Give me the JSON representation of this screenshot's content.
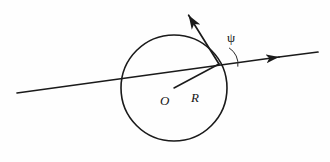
{
  "figure": {
    "background_color": "#fefefe",
    "ink_color": "#1a1a1a",
    "labels": {
      "center": "O",
      "radius": "R",
      "angle": "ψ"
    },
    "geometry": {
      "circle": {
        "center_x": 174,
        "center_y": 88,
        "radius": 53,
        "stroke_width": 1.6
      },
      "intersection_point": {
        "x": 219,
        "y": 64
      },
      "secant_line": {
        "start_x": 17,
        "start_y": 93,
        "end_x": 318,
        "end_y": 52,
        "stroke_width": 1.7,
        "arrowhead_x": 279,
        "arrowhead_y": 57
      },
      "ray_arrow": {
        "start_x": 219,
        "start_y": 64,
        "end_x": 186,
        "end_y": 11,
        "stroke_width": 1.7
      },
      "radius_line": {
        "start_x": 174,
        "start_y": 88,
        "end_x": 219,
        "end_y": 64,
        "stroke_width": 1.5
      },
      "angle_arc": {
        "center_x": 219,
        "center_y": 64,
        "arc_radius": 19,
        "start_angle_deg": 58,
        "end_angle_deg": 352
      },
      "label_positions": {
        "O": {
          "x": 160,
          "y": 105
        },
        "R": {
          "x": 191,
          "y": 102
        },
        "psi": {
          "x": 227,
          "y": 42
        }
      }
    }
  }
}
